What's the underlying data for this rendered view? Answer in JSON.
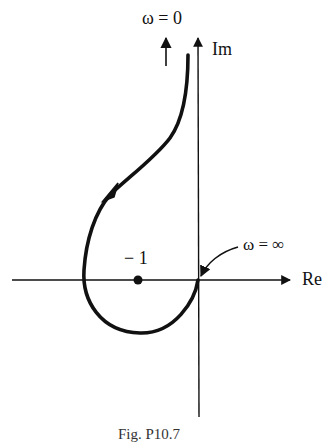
{
  "figure": {
    "type": "Nyquist plot",
    "labels": {
      "omega_zero": "ω = 0",
      "imag_axis": "Im",
      "real_axis": "Re",
      "minus_one": "− 1",
      "omega_infinity": "ω = ∞",
      "caption": "Fig. P10.7"
    },
    "colors": {
      "stroke": "#111111",
      "background": "#ffffff"
    },
    "elements": {
      "critical_point": {
        "re": -1,
        "im": 0
      },
      "curve_start": "ω = 0 at Im → +∞, slightly left of Im axis",
      "curve_end": "ω = ∞ at origin",
      "direction_arrow": "on curve in upper-left, pointing down-left"
    }
  }
}
